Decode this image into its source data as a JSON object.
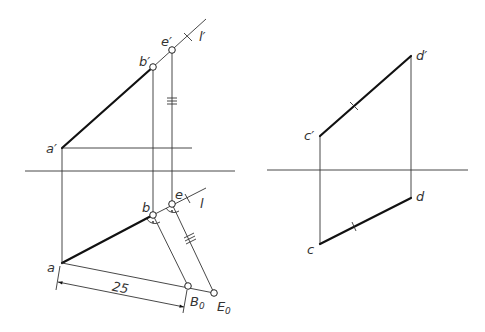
{
  "diagram": {
    "type": "descriptive-geometry-projection",
    "left_view": {
      "labels": {
        "a_prime": "a′",
        "b_prime": "b′",
        "e_prime": "e′",
        "l_prime": "l′",
        "a": "a",
        "b": "b",
        "e": "e",
        "l": "l",
        "B0": "B",
        "B0_sub": "0",
        "E0": "E",
        "E0_sub": "0"
      },
      "dimension": {
        "value": "25"
      },
      "marks": {
        "triple_tick": "≡",
        "single_tick": "×"
      }
    },
    "right_view": {
      "labels": {
        "c_prime": "c′",
        "d_prime": "d′",
        "c": "c",
        "d": "d"
      }
    },
    "colors": {
      "line": "#222222",
      "background": "#ffffff"
    }
  }
}
